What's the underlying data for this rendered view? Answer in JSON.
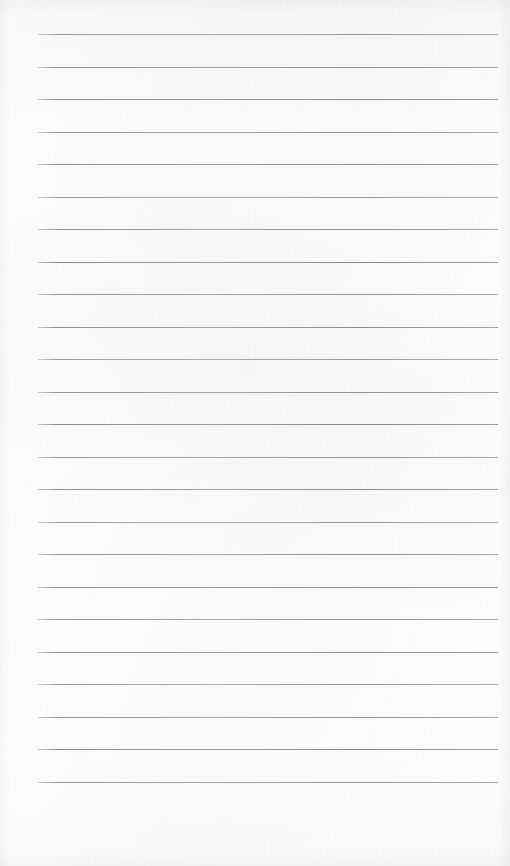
{
  "document": {
    "type": "lined-notepad-page",
    "title": "",
    "body_text": "",
    "is_blank": true,
    "page_width": 510,
    "page_height": 866,
    "paper_color": "#fdfdfd",
    "rule_color": "#8a8a90",
    "ruling": {
      "line_count": 24,
      "first_line_y": 34,
      "line_spacing": 32.5,
      "line_start_x": 38,
      "line_end_x": 498,
      "line_thickness": 1,
      "has_vertical_margin_rule": false,
      "lines_y": [
        34,
        66.5,
        99,
        131.5,
        164,
        196.5,
        229,
        261.5,
        294,
        326.5,
        359,
        391.5,
        424,
        456.5,
        489,
        521.5,
        554,
        586.5,
        619,
        651.5,
        684,
        716.5,
        749,
        781.5
      ]
    },
    "written_content": []
  }
}
